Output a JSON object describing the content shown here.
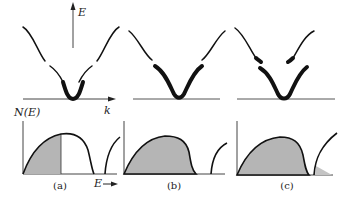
{
  "figure": {
    "axis_labels": {
      "energy": "E",
      "wavevector": "k",
      "dos": "N(E)",
      "energy_bottom": "E"
    },
    "panels": [
      {
        "id": "a",
        "caption": "(a)",
        "description": "Partially filled band: occupied states shaded up to mid-band"
      },
      {
        "id": "b",
        "caption": "(b)",
        "description": "Completely filled lower band"
      },
      {
        "id": "c",
        "caption": "(c)",
        "description": "Overlapping bands: filled lower band plus small occupancy of upper band"
      }
    ],
    "colors": {
      "curve": "#111111",
      "shade": "#b5b5b5",
      "axis": "#444444"
    }
  }
}
